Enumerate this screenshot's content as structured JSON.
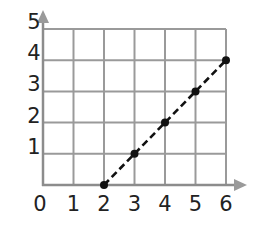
{
  "chart_data": {
    "type": "line",
    "title": "",
    "xlabel": "",
    "ylabel": "",
    "x_ticks": [
      "0",
      "1",
      "2",
      "3",
      "4",
      "5",
      "6"
    ],
    "y_ticks": [
      "1",
      "2",
      "3",
      "4",
      "5"
    ],
    "xlim": [
      0,
      6
    ],
    "ylim": [
      0,
      5
    ],
    "grid": true,
    "legend": null,
    "series": [
      {
        "name": "line",
        "style": "dashed",
        "markers": true,
        "color": "#111111",
        "x": [
          2,
          3,
          4,
          5,
          6
        ],
        "y": [
          0,
          1,
          2,
          3,
          4
        ]
      }
    ]
  },
  "colors": {
    "grid": "#9a9a9a",
    "axis": "#8c8c8c",
    "line": "#111111",
    "text": "#222222"
  }
}
